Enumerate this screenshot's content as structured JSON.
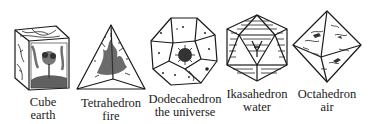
{
  "figure": {
    "solids": [
      {
        "name": "Cube",
        "element": "earth",
        "motif": "tree"
      },
      {
        "name": "Tetrahedron",
        "element": "fire",
        "motif": "flames"
      },
      {
        "name": "Dodecahedron",
        "element": "the universe",
        "motif": "star"
      },
      {
        "name": "Ikasahedron",
        "element": "water",
        "motif": "waves"
      },
      {
        "name": "Octahedron",
        "element": "air",
        "motif": "clouds"
      }
    ]
  }
}
